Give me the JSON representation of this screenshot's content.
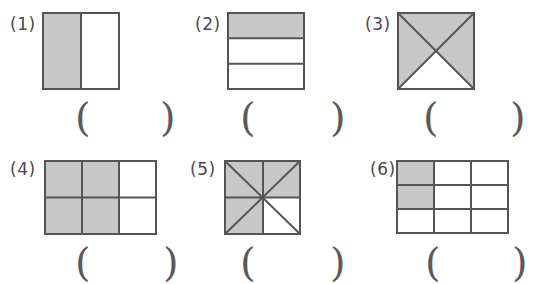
{
  "page": {
    "kind": "math-worksheet-fraction-shading",
    "background_color": "#ffffff",
    "shade_color": "#c8c8c8",
    "stroke_color": "#555555",
    "label_color": "#4a4a4a",
    "width": 548,
    "height": 284
  },
  "answer_field": {
    "open_paren": "(",
    "close_paren": ")",
    "value": ""
  },
  "problems": [
    {
      "label": "(1)",
      "figure_name": "square-halves-left-shaded",
      "shape": "square",
      "partition": "vertical-halves",
      "total_parts": 2,
      "shaded_parts": 1,
      "fraction": "1/2",
      "answer": ""
    },
    {
      "label": "(2)",
      "figure_name": "square-thirds-top-shaded",
      "shape": "square",
      "partition": "horizontal-thirds",
      "total_parts": 3,
      "shaded_parts": 1,
      "fraction": "1/3",
      "answer": ""
    },
    {
      "label": "(3)",
      "figure_name": "square-diagonals-four-triangles",
      "shape": "square",
      "partition": "both-diagonals",
      "total_parts": 4,
      "shaded_parts": 3,
      "fraction": "3/4",
      "answer": ""
    },
    {
      "label": "(4)",
      "figure_name": "rectangle-grid-3x2",
      "shape": "rectangle",
      "partition": "grid-3-columns-2-rows",
      "total_parts": 6,
      "shaded_parts": 4,
      "fraction": "4/6",
      "answer": ""
    },
    {
      "label": "(5)",
      "figure_name": "square-eight-triangles",
      "shape": "square",
      "partition": "diagonals-and-midlines",
      "total_parts": 8,
      "shaded_parts": 6,
      "fraction": "6/8",
      "answer": ""
    },
    {
      "label": "(6)",
      "figure_name": "rectangle-grid-3x3",
      "shape": "rectangle",
      "partition": "grid-3-columns-3-rows",
      "total_parts": 9,
      "shaded_parts": 2,
      "fraction": "2/9",
      "answer": ""
    }
  ]
}
